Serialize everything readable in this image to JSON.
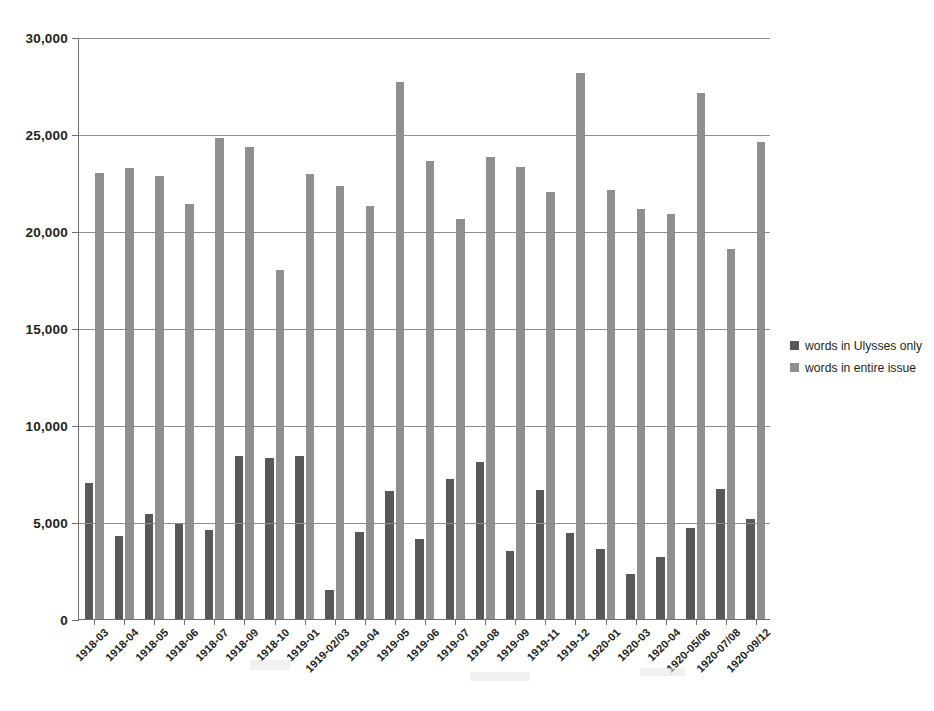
{
  "chart_data": {
    "type": "bar",
    "title": "",
    "subtitle": "",
    "xlabel": "",
    "ylabel": "",
    "ylim": [
      0,
      30000
    ],
    "ytick_values": [
      0,
      5000,
      10000,
      15000,
      20000,
      25000,
      30000
    ],
    "ytick_labels": [
      "0",
      "5,000",
      "10,000",
      "15,000",
      "20,000",
      "25,000",
      "30,000"
    ],
    "grid": true,
    "legend_position": "right",
    "categories": [
      "1918-03",
      "1918-04",
      "1918-05",
      "1918-06",
      "1918-07",
      "1918-09",
      "1918-10",
      "1919-01",
      "1919-02/03",
      "1919-04",
      "1919-05",
      "1919-06",
      "1919-07",
      "1919-08",
      "1919-09",
      "1919-11",
      "1919-12",
      "1920-01",
      "1920-03",
      "1920-04",
      "1920-05/06",
      "1920-07/08",
      "1920-09/12"
    ],
    "series": [
      {
        "name": "words in Ulysses only",
        "color": "#585858",
        "values": [
          7000,
          4300,
          5400,
          4900,
          4600,
          8400,
          8300,
          8400,
          1500,
          4500,
          6600,
          4150,
          7200,
          8100,
          3500,
          6650,
          4450,
          3600,
          2300,
          3200,
          4700,
          6700,
          5150
        ]
      },
      {
        "name": "words in entire issue",
        "color": "#8f8f8f",
        "values": [
          23000,
          23250,
          22850,
          21400,
          24800,
          24350,
          18000,
          22950,
          22300,
          21300,
          27700,
          23600,
          20600,
          23800,
          23300,
          22000,
          28150,
          22100,
          21150,
          20900,
          27100,
          19050,
          24600
        ]
      }
    ]
  },
  "legend": {
    "entries": [
      {
        "label": "words in Ulysses only",
        "swatch_color": "#585858"
      },
      {
        "label": "words in entire issue",
        "swatch_color": "#8f8f8f"
      }
    ]
  },
  "axis": {
    "y_max_label": "30,000",
    "y_min_label": "0"
  }
}
